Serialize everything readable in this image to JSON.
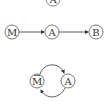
{
  "diagram": {
    "top_node": {
      "label": "A"
    },
    "chain": {
      "nodes": [
        {
          "label": "M"
        },
        {
          "label": "A"
        },
        {
          "label": "B"
        }
      ],
      "edges": [
        {
          "from": "M",
          "to": "A"
        },
        {
          "from": "A",
          "to": "B"
        }
      ]
    },
    "cycle": {
      "nodes": [
        {
          "label": "M",
          "overbar": true
        },
        {
          "label": "A"
        }
      ],
      "edges": [
        {
          "from": "M",
          "to": "A",
          "direction": "top-arc"
        },
        {
          "from": "A",
          "to": "M",
          "direction": "bottom-arc"
        }
      ]
    },
    "colors": {
      "stroke": "#444444",
      "background": "#ffffff"
    }
  }
}
